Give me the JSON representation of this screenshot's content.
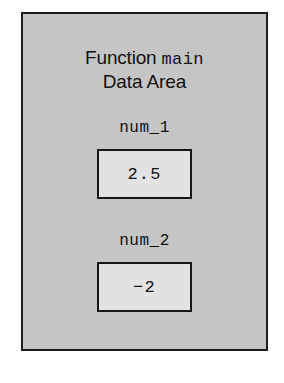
{
  "panel": {
    "title_line_1_prefix": "Function ",
    "title_line_1_identifier": "main",
    "title_line_2": "Data Area",
    "background_color": "#c5c5c5",
    "border_color": "#1c1c1c"
  },
  "variables": [
    {
      "label": "num_1",
      "value": "2.5",
      "box_fill_color": "#e2e2e2",
      "box_border_color": "#161616"
    },
    {
      "label": "num_2",
      "value": "−2",
      "box_fill_color": "#e2e2e2",
      "box_border_color": "#161616"
    }
  ]
}
